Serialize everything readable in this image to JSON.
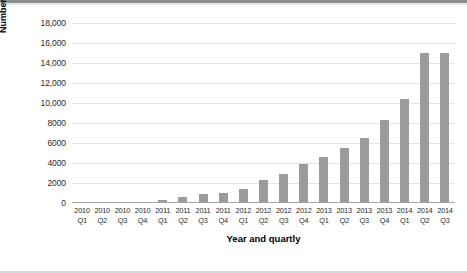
{
  "chart_data": {
    "type": "bar",
    "title": "",
    "xlabel": "Year and quartly",
    "ylabel": "Number of vehicles licenced",
    "categories": [
      "2010 Q1",
      "2010 Q2",
      "2010 Q3",
      "2010 Q4",
      "2011 Q1",
      "2011 Q2",
      "2011 Q3",
      "2011 Q4",
      "2012 Q1",
      "2012 Q2",
      "2012 Q3",
      "2012 Q4",
      "2013 Q1",
      "2013 Q2",
      "2013 Q3",
      "2013 Q4",
      "2014 Q1",
      "2014 Q2",
      "2014 Q3"
    ],
    "category_lines": [
      {
        "year": "2010",
        "quarter": "Q1"
      },
      {
        "year": "2010",
        "quarter": "Q2"
      },
      {
        "year": "2010",
        "quarter": "Q3"
      },
      {
        "year": "2010",
        "quarter": "Q4"
      },
      {
        "year": "2011",
        "quarter": "Q1"
      },
      {
        "year": "2011",
        "quarter": "Q2"
      },
      {
        "year": "2011",
        "quarter": "Q3"
      },
      {
        "year": "2011",
        "quarter": "Q4"
      },
      {
        "year": "2012",
        "quarter": "Q1"
      },
      {
        "year": "2012",
        "quarter": "Q2"
      },
      {
        "year": "2012",
        "quarter": "Q3"
      },
      {
        "year": "2012",
        "quarter": "Q4"
      },
      {
        "year": "2013",
        "quarter": "Q1"
      },
      {
        "year": "2013",
        "quarter": "Q2"
      },
      {
        "year": "2013",
        "quarter": "Q3"
      },
      {
        "year": "2013",
        "quarter": "Q4"
      },
      {
        "year": "2014",
        "quarter": "Q1"
      },
      {
        "year": "2014",
        "quarter": "Q2"
      },
      {
        "year": "2014",
        "quarter": "Q3"
      }
    ],
    "values": [
      60,
      70,
      90,
      110,
      300,
      620,
      900,
      1050,
      1400,
      2300,
      2950,
      3870,
      4600,
      5500,
      6550,
      8300,
      10400,
      15000,
      15000
    ],
    "ylim": [
      0,
      18000
    ],
    "ytick_values": [
      0,
      2000,
      4000,
      6000,
      8000,
      10000,
      12000,
      14000,
      16000,
      18000
    ],
    "ytick_labels": [
      "0",
      "2000",
      "4000",
      "6000",
      "8000",
      "10,000",
      "12,000",
      "14,000",
      "16,000",
      "18,000"
    ],
    "grid": true,
    "legend": false,
    "bar_color": "#9b9b9b",
    "gridline_color": "#e4e4e4",
    "axis_color": "#a6a6a6"
  }
}
